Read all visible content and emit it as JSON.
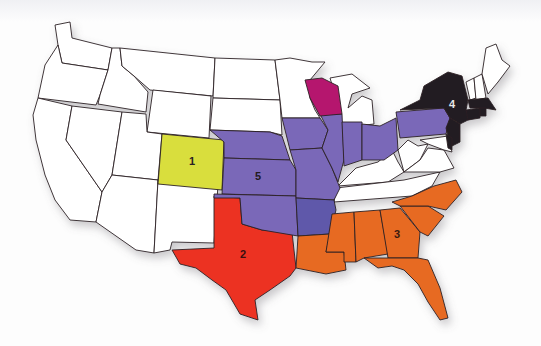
{
  "map": {
    "title": "United States regional map",
    "regions": [
      {
        "id": "1",
        "label": "1",
        "color": "#d9de3e",
        "states": [
          "Colorado"
        ]
      },
      {
        "id": "2",
        "label": "2",
        "color": "#ec3224",
        "states": [
          "Texas"
        ]
      },
      {
        "id": "3",
        "label": "3",
        "color": "#e76a24",
        "states": [
          "Louisiana",
          "Mississippi",
          "Alabama",
          "Georgia",
          "Florida",
          "South Carolina",
          "North Carolina"
        ]
      },
      {
        "id": "4",
        "label": "4",
        "color": "#231a20",
        "label_color": "#e8e8e8",
        "states": [
          "New York",
          "New Jersey",
          "Connecticut",
          "Rhode Island",
          "Massachusetts",
          "Delaware"
        ]
      },
      {
        "id": "5",
        "label": "5",
        "color": "#7a68b8",
        "states": [
          "Nebraska",
          "Kansas",
          "Oklahoma",
          "Iowa",
          "Missouri",
          "Illinois",
          "Indiana",
          "Ohio",
          "Pennsylvania"
        ]
      }
    ],
    "other_colors": {
      "wisconsin": "#b5196e",
      "arkansas": "#5e58aa",
      "unassigned": "#ffffff",
      "border": "#2b2024",
      "lake_shadow": "#c9c8cc"
    }
  }
}
